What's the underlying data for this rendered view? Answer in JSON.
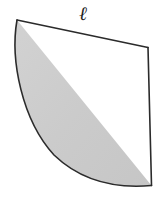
{
  "figure": {
    "kind": "geometry-diagram",
    "shape_name": "circular-sector",
    "background_color": "#ffffff",
    "fill_color": "#cccccc",
    "stroke_color": "#2b2b2b",
    "stroke_width": 1.6,
    "labels": {
      "arc_length": "ℓ"
    },
    "geometry": {
      "center_x": 152,
      "center_y": 186,
      "radius": 140,
      "vertex_top_left_x": 17,
      "vertex_top_left_y": 20,
      "vertex_top_right_x": 148,
      "vertex_top_right_y": 48,
      "arc_start_x": 17,
      "arc_start_y": 20,
      "arc_end_x": 152,
      "arc_end_y": 186,
      "arc_sweep_flag": 1,
      "arc_large_flag": 0,
      "path": "M 152 186 L 17 20 A 140 140 0 0 0 131 182 L 152 186 Z"
    }
  }
}
